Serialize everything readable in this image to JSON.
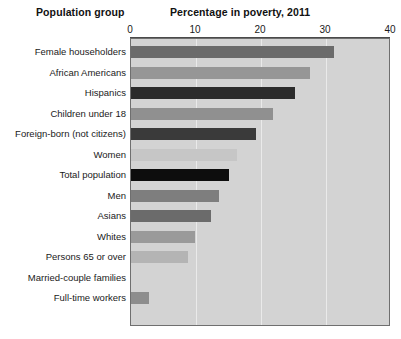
{
  "header": {
    "group_title": "Population group",
    "value_title": "Percentage in poverty, 2011"
  },
  "chart_data": {
    "type": "bar",
    "orientation": "horizontal",
    "title": "Percentage in poverty, 2011",
    "xlabel": "Percentage in poverty, 2011",
    "ylabel": "Population group",
    "xlim": [
      0,
      40
    ],
    "xticks": [
      0,
      10,
      20,
      30,
      40
    ],
    "xtick_labels": [
      "0",
      "10",
      "20",
      "30",
      "40"
    ],
    "grid": true,
    "grid_axis": "x",
    "legend": false,
    "plot_background": "#d3d3d3",
    "categories": [
      "Female householders",
      "African Americans",
      "Hispanics",
      "Children under 18",
      "Foreign-born (not citizens)",
      "Women",
      "Total population",
      "Men",
      "Asians",
      "Whites",
      "Persons 65 or over",
      "Married-couple families",
      "Full-time workers"
    ],
    "values": [
      31.2,
      27.6,
      25.3,
      21.9,
      19.2,
      16.3,
      15.0,
      13.6,
      12.3,
      9.8,
      8.7,
      0.0,
      2.8
    ],
    "bar_colors": [
      "#6b6b6b",
      "#969696",
      "#2b2b2b",
      "#909090",
      "#3a3a3a",
      "#c6c6c6",
      "#0d0d0d",
      "#7e7e7e",
      "#6b6b6b",
      "#9a9a9a",
      "#b4b4b4",
      "#cfcfcf",
      "#8d8d8d"
    ]
  }
}
